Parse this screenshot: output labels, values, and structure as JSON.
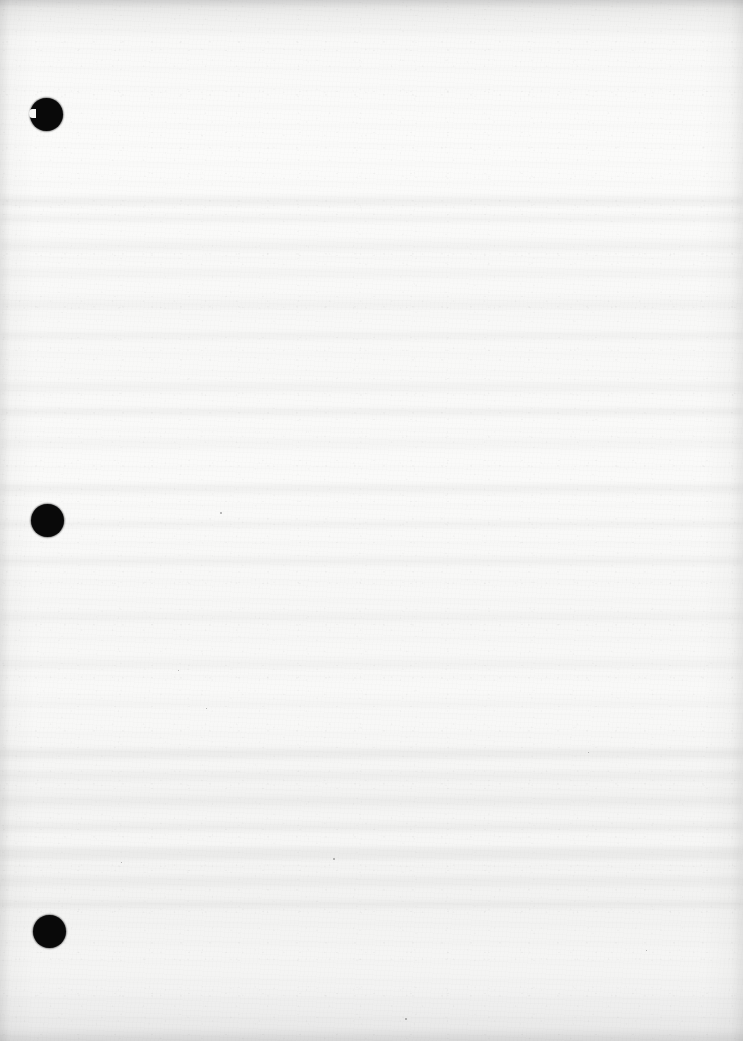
{
  "document": {
    "page_kind": "scanned-blank-page",
    "page_text": "",
    "caption": "Blank scanned page with three punch holes in left margin",
    "width_px": 743,
    "height_px": 1041
  },
  "colors": {
    "paper": "#f8f8f7",
    "paper_edge": "#ededec",
    "hole": "#0b0b0b",
    "ghost_band": "#000000",
    "speck": "#000000"
  },
  "punch_holes": [
    {
      "name": "punch-hole-top",
      "x": 30,
      "y": 98,
      "diameter": 33,
      "has_nick": true
    },
    {
      "name": "punch-hole-middle",
      "x": 31,
      "y": 504,
      "diameter": 33,
      "has_nick": false
    },
    {
      "name": "punch-hole-bottom",
      "x": 33,
      "y": 915,
      "diameter": 33,
      "has_nick": false
    }
  ],
  "ghost_bands": [
    {
      "y": 196,
      "height": 10,
      "opacity": 0.03
    },
    {
      "y": 214,
      "height": 8,
      "opacity": 0.022
    },
    {
      "y": 242,
      "height": 9,
      "opacity": 0.026
    },
    {
      "y": 268,
      "height": 8,
      "opacity": 0.02
    },
    {
      "y": 300,
      "height": 10,
      "opacity": 0.024
    },
    {
      "y": 332,
      "height": 8,
      "opacity": 0.018
    },
    {
      "y": 382,
      "height": 9,
      "opacity": 0.022
    },
    {
      "y": 408,
      "height": 8,
      "opacity": 0.026
    },
    {
      "y": 438,
      "height": 9,
      "opacity": 0.02
    },
    {
      "y": 484,
      "height": 10,
      "opacity": 0.028
    },
    {
      "y": 520,
      "height": 8,
      "opacity": 0.02
    },
    {
      "y": 556,
      "height": 9,
      "opacity": 0.022
    },
    {
      "y": 612,
      "height": 8,
      "opacity": 0.018
    },
    {
      "y": 660,
      "height": 9,
      "opacity": 0.022
    },
    {
      "y": 700,
      "height": 8,
      "opacity": 0.02
    },
    {
      "y": 748,
      "height": 11,
      "opacity": 0.032
    },
    {
      "y": 772,
      "height": 9,
      "opacity": 0.024
    },
    {
      "y": 796,
      "height": 10,
      "opacity": 0.03
    },
    {
      "y": 822,
      "height": 9,
      "opacity": 0.026
    },
    {
      "y": 848,
      "height": 12,
      "opacity": 0.038
    },
    {
      "y": 876,
      "height": 9,
      "opacity": 0.028
    },
    {
      "y": 900,
      "height": 8,
      "opacity": 0.022
    }
  ],
  "specks": [
    {
      "name": "speck-1",
      "x": 220,
      "y": 512,
      "size": 2
    },
    {
      "name": "speck-2",
      "x": 333,
      "y": 858,
      "size": 2
    },
    {
      "name": "speck-3",
      "x": 405,
      "y": 1018,
      "size": 2
    },
    {
      "name": "speck-4",
      "x": 206,
      "y": 708,
      "size": 1
    },
    {
      "name": "speck-5",
      "x": 588,
      "y": 752,
      "size": 1
    },
    {
      "name": "speck-6",
      "x": 178,
      "y": 670,
      "size": 1
    },
    {
      "name": "speck-7",
      "x": 121,
      "y": 862,
      "size": 1
    },
    {
      "name": "speck-8",
      "x": 646,
      "y": 950,
      "size": 1
    }
  ]
}
